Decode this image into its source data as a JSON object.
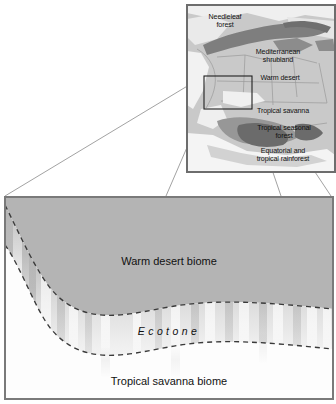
{
  "figure": {
    "map_inset": {
      "name": "world-biome-map-inset",
      "labels": [
        {
          "id": "needleleaf-forest",
          "text": "Needleleaf\nforest",
          "x": 12,
          "y": 8,
          "w": 52
        },
        {
          "id": "mediterranean",
          "text": "Mediterranean\nshrubland",
          "x": 58,
          "y": 43,
          "w": 66
        },
        {
          "id": "warm-desert",
          "text": "Warm desert",
          "x": 62,
          "y": 69,
          "w": 62
        },
        {
          "id": "tropical-savanna",
          "text": "Tropical savanna",
          "x": 56,
          "y": 102,
          "w": 80
        },
        {
          "id": "tropical-seasonal",
          "text": "Tropical seasonal\nforest",
          "x": 56,
          "y": 119,
          "w": 82
        },
        {
          "id": "equatorial-rainfor",
          "text": "Equatorial and\ntropical rainforest",
          "x": 52,
          "y": 143,
          "w": 88
        }
      ],
      "selection_box": {
        "x": 17,
        "y": 71,
        "w": 48,
        "h": 33
      }
    },
    "detail_panel": {
      "name": "ecotone-detail-panel",
      "labels": {
        "upper_biome": "Warm desert biome",
        "transition": "Ecotone",
        "lower_biome": "Tropical savanna biome"
      }
    },
    "colors": {
      "desert_fill": "#b4b4b4",
      "savanna_fill": "#fbfbfb",
      "map_background": "#c9c9c9",
      "map_dark": "#7e7e7e",
      "map_light": "#f2f2f2",
      "border": "#6d6d6d",
      "dash_line": "#3a3a3a",
      "text": "#111111"
    }
  }
}
